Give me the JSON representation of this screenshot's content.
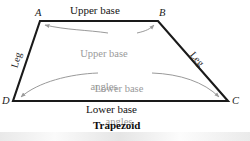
{
  "figure": {
    "caption": "Trapezoid",
    "vertices": [
      {
        "name": "A",
        "label": "A",
        "x": 40,
        "y": 21
      },
      {
        "name": "B",
        "label": "B",
        "x": 158,
        "y": 21
      },
      {
        "name": "C",
        "label": "C",
        "x": 228,
        "y": 101
      },
      {
        "name": "D",
        "label": "D",
        "x": 13,
        "y": 101
      }
    ],
    "sides": {
      "upper_base_label": "Upper base",
      "lower_base_label": "Lower base",
      "left_leg_label": "Leg",
      "right_leg_label": "Leg"
    },
    "annotations": {
      "upper_angles_line1": "Upper base",
      "upper_angles_line2": "angles",
      "lower_angles_line1": "Lower base",
      "lower_angles_line2": "angles"
    },
    "colors": {
      "outline": "#1a1a1a",
      "annotation_gray": "#9a9a9a",
      "text_black": "#141414",
      "background": "#ffffff"
    }
  }
}
